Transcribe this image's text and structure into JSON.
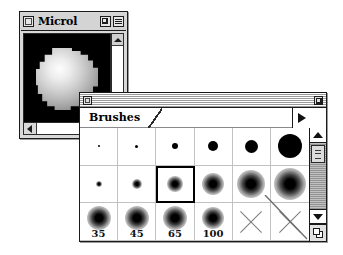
{
  "document_window": {
    "title": "Microl",
    "close_box": "close-box",
    "zoom_box": "zoom-box",
    "collapse_box": "collapse-box",
    "canvas": {
      "background_color": "#000000",
      "content": "airbrush-blob",
      "blob_colors": [
        "#fdfdfd",
        "#b3b3b3",
        "#6e6e6e"
      ]
    },
    "scroll_up_arrow": "scroll-up-arrow",
    "scroll_left_arrow": "scroll-left-arrow"
  },
  "brushes_palette": {
    "close_box": "close-box",
    "zoom_box": "zoom-box",
    "tabs": [
      {
        "label": "Brushes",
        "active": true
      }
    ],
    "palette_menu": "palette-menu-triangle",
    "selected_index": 8,
    "columns": 6,
    "rows": 3,
    "brushes": [
      {
        "index": 0,
        "row": 1,
        "col": 1,
        "kind": "hard",
        "diameter_px": 2,
        "label": ""
      },
      {
        "index": 1,
        "row": 1,
        "col": 2,
        "kind": "hard",
        "diameter_px": 3,
        "label": ""
      },
      {
        "index": 2,
        "row": 1,
        "col": 3,
        "kind": "hard",
        "diameter_px": 6,
        "label": ""
      },
      {
        "index": 3,
        "row": 1,
        "col": 4,
        "kind": "hard",
        "diameter_px": 10,
        "label": ""
      },
      {
        "index": 4,
        "row": 1,
        "col": 5,
        "kind": "hard",
        "diameter_px": 13,
        "label": ""
      },
      {
        "index": 5,
        "row": 1,
        "col": 6,
        "kind": "hard",
        "diameter_px": 24,
        "label": ""
      },
      {
        "index": 6,
        "row": 2,
        "col": 1,
        "kind": "soft",
        "diameter_px": 6,
        "label": ""
      },
      {
        "index": 7,
        "row": 2,
        "col": 2,
        "kind": "soft",
        "diameter_px": 10,
        "label": ""
      },
      {
        "index": 8,
        "row": 2,
        "col": 3,
        "kind": "soft",
        "diameter_px": 16,
        "label": ""
      },
      {
        "index": 9,
        "row": 2,
        "col": 4,
        "kind": "soft",
        "diameter_px": 22,
        "label": ""
      },
      {
        "index": 10,
        "row": 2,
        "col": 5,
        "kind": "soft",
        "diameter_px": 28,
        "label": ""
      },
      {
        "index": 11,
        "row": 2,
        "col": 6,
        "kind": "soft",
        "diameter_px": 32,
        "label": ""
      },
      {
        "index": 12,
        "row": 3,
        "col": 1,
        "kind": "soft",
        "diameter_px": 24,
        "label": "35"
      },
      {
        "index": 13,
        "row": 3,
        "col": 2,
        "kind": "soft",
        "diameter_px": 24,
        "label": "45"
      },
      {
        "index": 14,
        "row": 3,
        "col": 3,
        "kind": "soft",
        "diameter_px": 24,
        "label": "65"
      },
      {
        "index": 15,
        "row": 3,
        "col": 4,
        "kind": "soft",
        "diameter_px": 22,
        "label": "100"
      },
      {
        "index": 16,
        "row": 3,
        "col": 5,
        "kind": "empty",
        "diameter_px": 0,
        "label": ""
      },
      {
        "index": 17,
        "row": 3,
        "col": 6,
        "kind": "empty",
        "diameter_px": 0,
        "label": ""
      }
    ],
    "scrollbar": {
      "up_arrow": "scroll-up-arrow",
      "down_arrow": "scroll-down-arrow",
      "thumb": "scroll-thumb",
      "grow_box": "grow-box"
    }
  },
  "colors": {
    "desktop": "#ffffff",
    "brush_ink": "#000000",
    "chrome": "#d4d4d4",
    "grid_line": "#c2c2c2",
    "track": "#a5a5a5"
  }
}
